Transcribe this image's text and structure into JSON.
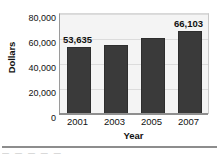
{
  "chart_data": {
    "type": "bar",
    "title": "",
    "xlabel": "Year",
    "ylabel": "Dollars",
    "categories": [
      "2001",
      "2003",
      "2005",
      "2007"
    ],
    "values": [
      53635,
      55500,
      61000,
      66103
    ],
    "value_labels": [
      "53,635",
      "",
      "",
      "66,103"
    ],
    "ylim": [
      0,
      80000
    ],
    "yticks": [
      0,
      20000,
      40000,
      60000,
      80000
    ],
    "ytick_labels": [
      "0",
      "20,000",
      "40,000",
      "60,000",
      "80,000"
    ],
    "grid": true,
    "legend": false,
    "bar_color": "#3a3a3a",
    "plot_background": "#f4f4f4",
    "gridline_color": "#dcdcdc",
    "axis_color": "#8f8f8f",
    "text_color": "#111111"
  },
  "footer": {
    "cutoff_text": "—    — —   —         —"
  }
}
